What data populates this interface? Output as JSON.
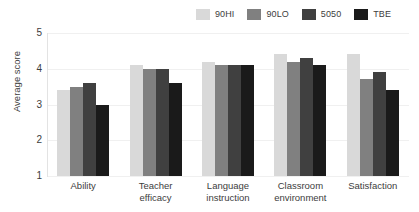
{
  "chart_data": {
    "type": "bar",
    "title": "",
    "subtitle": "",
    "xlabel": "",
    "ylabel": "Average score",
    "ylim": [
      1,
      5
    ],
    "yticks": [
      "5",
      "4",
      "3",
      "2",
      "1"
    ],
    "grid": true,
    "legend_position": "top-right",
    "categories": [
      "Ability",
      "Teacher\nefficacy",
      "Language\ninstruction",
      "Classroom\nenvironment",
      "Satisfaction"
    ],
    "series": [
      {
        "name": "90HI",
        "color": "#d9d9d9",
        "values": [
          3.4,
          4.1,
          4.2,
          4.4,
          4.4
        ]
      },
      {
        "name": "90LO",
        "color": "#808080",
        "values": [
          3.5,
          4.0,
          4.1,
          4.2,
          3.7
        ]
      },
      {
        "name": "5050",
        "color": "#404040",
        "values": [
          3.6,
          4.0,
          4.1,
          4.3,
          3.9
        ]
      },
      {
        "name": "TBE",
        "color": "#1a1a1a",
        "values": [
          3.0,
          3.6,
          4.1,
          4.1,
          3.4
        ]
      }
    ]
  },
  "legend": {
    "items": [
      {
        "label": "90HI",
        "color": "#d9d9d9"
      },
      {
        "label": "90LO",
        "color": "#808080"
      },
      {
        "label": "5050",
        "color": "#404040"
      },
      {
        "label": "TBE",
        "color": "#1a1a1a"
      }
    ]
  },
  "axis": {
    "y_title": "Average score",
    "y_tick_labels": [
      "5",
      "4",
      "3",
      "2",
      "1"
    ]
  },
  "x_labels": [
    "Ability",
    "Teacher efficacy",
    "Language instruction",
    "Classroom environment",
    "Satisfaction"
  ]
}
